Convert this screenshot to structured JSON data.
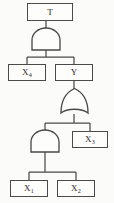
{
  "diagram": {
    "type": "fault-tree",
    "background_color": "#fbfbf9",
    "line_color": "#4a4a4a",
    "box_fill": "#fdfdfc",
    "nodes": [
      {
        "id": "top",
        "label": "T",
        "base": "T",
        "sub": "",
        "kind": "event-box",
        "role": "top-event"
      },
      {
        "id": "g1",
        "label": "AND",
        "kind": "and-gate",
        "role": "top-gate"
      },
      {
        "id": "x4",
        "label": "X4",
        "base": "X",
        "sub": "4",
        "kind": "event-box",
        "role": "basic-event"
      },
      {
        "id": "y",
        "label": "Y",
        "base": "Y",
        "sub": "",
        "kind": "event-box",
        "role": "intermediate-event"
      },
      {
        "id": "g2",
        "label": "OR",
        "kind": "or-gate",
        "role": "mid-gate"
      },
      {
        "id": "g3",
        "label": "AND",
        "kind": "and-gate",
        "role": "bottom-gate"
      },
      {
        "id": "x3",
        "label": "X3",
        "base": "X",
        "sub": "3",
        "kind": "event-box",
        "role": "basic-event"
      },
      {
        "id": "x1",
        "label": "X1",
        "base": "X",
        "sub": "1",
        "kind": "event-box",
        "role": "basic-event"
      },
      {
        "id": "x2",
        "label": "X2",
        "base": "X",
        "sub": "2",
        "kind": "event-box",
        "role": "basic-event"
      }
    ],
    "edges": [
      {
        "from": "top",
        "to": "g1"
      },
      {
        "from": "g1",
        "to": "x4"
      },
      {
        "from": "g1",
        "to": "y"
      },
      {
        "from": "y",
        "to": "g2"
      },
      {
        "from": "g2",
        "to": "g3"
      },
      {
        "from": "g2",
        "to": "x3"
      },
      {
        "from": "g3",
        "to": "x1"
      },
      {
        "from": "g3",
        "to": "x2"
      }
    ],
    "labels": {
      "top": {
        "base": "T",
        "sub": ""
      },
      "x4": {
        "base": "X",
        "sub": "4"
      },
      "y": {
        "base": "Y",
        "sub": ""
      },
      "x3": {
        "base": "X",
        "sub": "3"
      },
      "x1": {
        "base": "X",
        "sub": "1"
      },
      "x2": {
        "base": "X",
        "sub": "2"
      }
    }
  }
}
